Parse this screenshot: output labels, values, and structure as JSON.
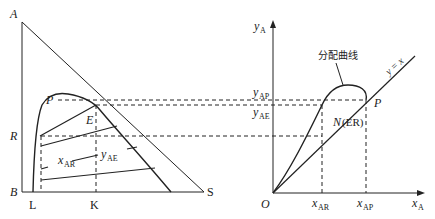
{
  "left_diagram": {
    "vertices": {
      "top": "A",
      "bottom_left": "B",
      "bottom_right": "S"
    },
    "left_axis_labels": {
      "plait_point": "P",
      "raffinate_level": "R"
    },
    "bottom_labels": {
      "raffinate_foot": "L",
      "extract_foot": "K"
    },
    "point_labels": {
      "extract": "E"
    },
    "tie_line_labels": {
      "x": "x",
      "x_sub": "AR",
      "y": "y",
      "y_sub": "AE"
    }
  },
  "right_diagram": {
    "y_axis": {
      "label": "y",
      "sub": "A"
    },
    "x_axis": {
      "label": "x",
      "sub": "A"
    },
    "origin": "O",
    "y_ticks": [
      {
        "label": "y",
        "sub": "AP"
      },
      {
        "label": "y",
        "sub": "AE"
      }
    ],
    "x_ticks": [
      {
        "label": "x",
        "sub": "AR"
      },
      {
        "label": "x",
        "sub": "AP"
      }
    ],
    "curve_label": "分配曲线",
    "diagonal_label": "y = x",
    "point_p": "P",
    "point_n": "N",
    "point_n_note": "(ER)"
  },
  "colors": {
    "line": "#222222",
    "background": "#ffffff"
  }
}
